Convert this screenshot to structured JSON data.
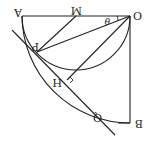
{
  "diagram": {
    "orientation": "rotated 180 degrees",
    "labels": {
      "O": "O",
      "A": "A",
      "M": "M",
      "B": "B",
      "P": "P",
      "H": "H",
      "Q": "Q",
      "theta": "θ"
    },
    "points": {
      "O": [
        130,
        16
      ],
      "A": [
        22,
        16
      ],
      "M": [
        76,
        16
      ],
      "B": [
        130,
        123
      ],
      "P": [
        37,
        52
      ],
      "H": [
        67,
        80
      ],
      "Q": [
        101,
        123
      ]
    },
    "stroke_color": "#222222"
  }
}
